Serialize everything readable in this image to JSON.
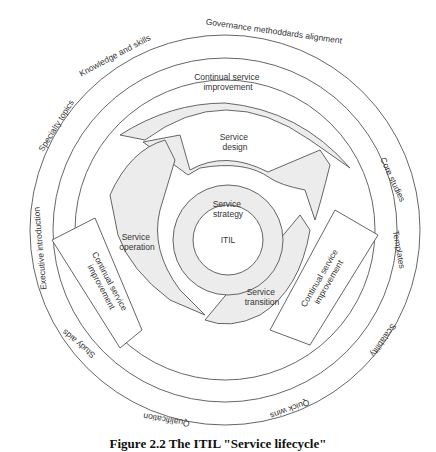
{
  "diagram": {
    "center": "ITIL",
    "core": {
      "strategy": [
        "Service",
        "strategy"
      ],
      "design": [
        "Service",
        "design"
      ],
      "transition": [
        "Service",
        "transition"
      ],
      "operation": [
        "Service",
        "operation"
      ]
    },
    "csi_top": [
      "Continual service",
      "improvement"
    ],
    "csi_left": [
      "Continual service",
      "improvement"
    ],
    "csi_right": [
      "Continual service",
      "improvement"
    ],
    "outer_ring": {
      "governance": "Governance methoddards alignment",
      "knowledge": "Knowledge and skills",
      "specialty": "Specialty topics",
      "executive": "Executive introduction",
      "study": "Study aids",
      "qualification": "Qualification",
      "quick_wins": "Quick wins",
      "scalability": "Scalability",
      "templates": "Templates",
      "core_studies": "Core studies"
    }
  },
  "caption": "Figure 2.2 The ITIL \"Service lifecycle\""
}
